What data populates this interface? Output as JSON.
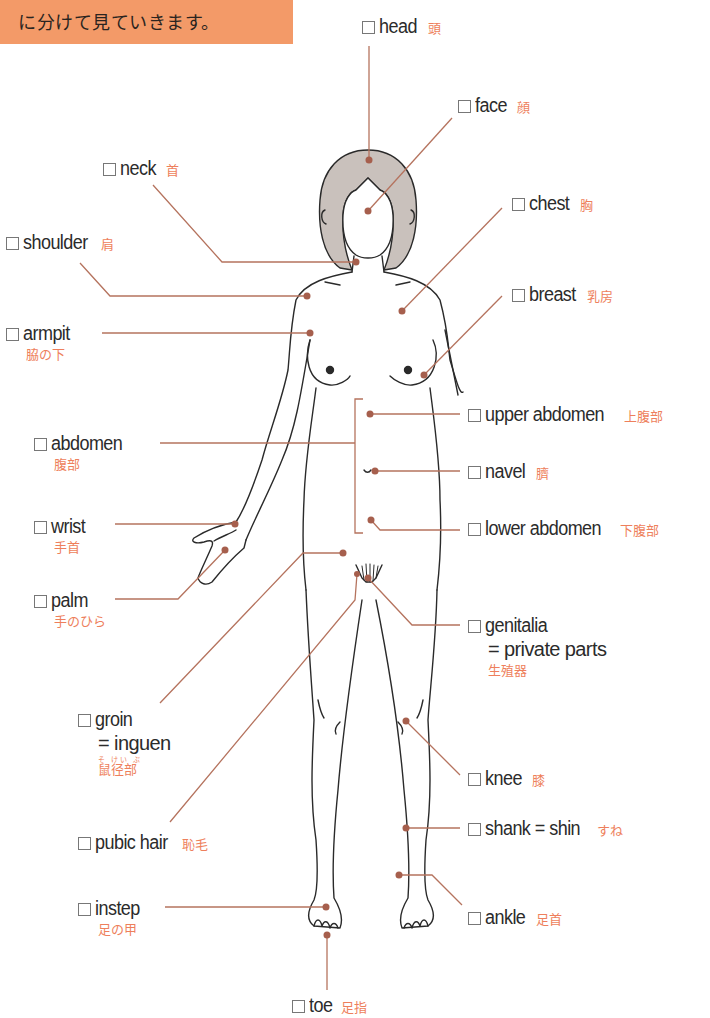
{
  "banner": {
    "text": "に分けて見ていきます。",
    "color": "#f39a68"
  },
  "colors": {
    "leader_line": "#b5735e",
    "dot": "#a65f4d",
    "japanese_text": "#ee7f5c",
    "hair": "#c9c1bc",
    "outline": "#2a2a2a"
  },
  "labels": {
    "head": {
      "en": "head",
      "ja": "頭"
    },
    "face": {
      "en": "face",
      "ja": "顔"
    },
    "neck": {
      "en": "neck",
      "ja": "首"
    },
    "chest": {
      "en": "chest",
      "ja": "胸"
    },
    "shoulder": {
      "en": "shoulder",
      "ja": "肩"
    },
    "breast": {
      "en": "breast",
      "ja": "乳房"
    },
    "armpit": {
      "en": "armpit",
      "ja": "脇の下"
    },
    "upper_abdomen": {
      "en": "upper abdomen",
      "ja": "上腹部"
    },
    "abdomen": {
      "en": "abdomen",
      "ja": "腹部"
    },
    "navel": {
      "en": "navel",
      "ja": "臍",
      "ruby": "へそ"
    },
    "wrist": {
      "en": "wrist",
      "ja": "手首"
    },
    "lower_abdomen": {
      "en": "lower abdomen",
      "ja": "下腹部"
    },
    "palm": {
      "en": "palm",
      "ja": "手のひら"
    },
    "genitalia": {
      "en": "genitalia",
      "en2": "= private parts",
      "ja": "生殖器"
    },
    "groin": {
      "en": "groin",
      "en2": "= inguen",
      "ja": "鼠径部",
      "ruby": "そ けい ぶ"
    },
    "knee": {
      "en": "knee",
      "ja": "膝"
    },
    "shank": {
      "en": "shank = shin",
      "ja": "すね"
    },
    "pubic_hair": {
      "en": "pubic hair",
      "ja": "恥毛"
    },
    "instep": {
      "en": "instep",
      "ja": "足の甲"
    },
    "ankle": {
      "en": "ankle",
      "ja": "足首"
    },
    "toe": {
      "en": "toe",
      "ja": "足指"
    }
  }
}
